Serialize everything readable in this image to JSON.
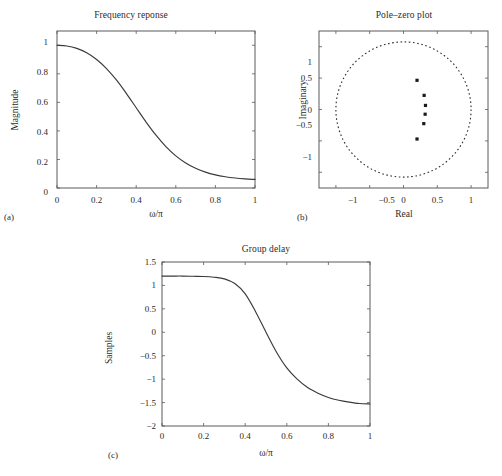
{
  "figure": {
    "background": "#ffffff",
    "line_color": "#3a3a3a",
    "axis_color": "#5a5a5a",
    "marker_color": "#1a1a1a"
  },
  "panels": {
    "a": {
      "caption": "(a)",
      "title": "Frequency reponse",
      "xlabel": "ω/π",
      "ylabel": "Magnitude",
      "xticks": [
        "0",
        "0.2",
        "0.4",
        "0.6",
        "0.8",
        "1"
      ],
      "yticks": [
        "0",
        "0.2",
        "0.4",
        "0.6",
        "0.8",
        "1"
      ]
    },
    "b": {
      "caption": "(b)",
      "title": "Pole–zero plot",
      "xlabel": "Real",
      "ylabel": "Imaginary",
      "xticks": [
        "−1",
        "−0.5",
        "0",
        "0.5",
        "1"
      ],
      "yticks": [
        "−1",
        "−0.5",
        "0",
        "0.5",
        "1"
      ]
    },
    "c": {
      "caption": "(c)",
      "title": "Group delay",
      "xlabel": "ω/π",
      "ylabel": "Samples",
      "xticks": [
        "0",
        "0.2",
        "0.4",
        "0.6",
        "0.8",
        "1"
      ],
      "yticks": [
        "1.5",
        "1",
        "0.5",
        "0",
        "−0.5",
        "−1",
        "−1.5",
        "−2"
      ]
    }
  },
  "chart_data": [
    {
      "type": "line",
      "id": "frequency-response",
      "title": "Frequency reponse",
      "xlabel": "ω/π",
      "ylabel": "Magnitude",
      "xlim": [
        0,
        1
      ],
      "ylim": [
        0,
        1.1
      ],
      "xticks": [
        0,
        0.2,
        0.4,
        0.6,
        0.8,
        1
      ],
      "yticks": [
        0,
        0.2,
        0.4,
        0.6,
        0.8,
        1
      ],
      "grid": false,
      "legend": null,
      "x": [
        0,
        0.05,
        0.1,
        0.15,
        0.2,
        0.25,
        0.3,
        0.35,
        0.4,
        0.45,
        0.5,
        0.55,
        0.6,
        0.65,
        0.7,
        0.75,
        0.8,
        0.85,
        0.9,
        0.95,
        1
      ],
      "values": [
        1.0,
        0.995,
        0.978,
        0.947,
        0.9,
        0.837,
        0.757,
        0.663,
        0.562,
        0.462,
        0.37,
        0.29,
        0.225,
        0.175,
        0.138,
        0.111,
        0.092,
        0.079,
        0.07,
        0.064,
        0.06
      ]
    },
    {
      "type": "scatter",
      "id": "pole-zero-plot",
      "title": "Pole–zero plot",
      "xlabel": "Real",
      "ylabel": "Imaginary",
      "xlim": [
        -1.25,
        1.25
      ],
      "ylim": [
        -1.25,
        1.25
      ],
      "xticks": [
        -1,
        -0.5,
        0,
        0.5,
        1
      ],
      "yticks": [
        -1,
        -0.5,
        0,
        0.5,
        1
      ],
      "grid": false,
      "legend": null,
      "unit_circle": {
        "radius": 1,
        "style": "dashed",
        "center": [
          0,
          0
        ]
      },
      "points_label": "poles",
      "points": [
        {
          "real": 0.2,
          "imag": 0.465
        },
        {
          "real": 0.305,
          "imag": 0.225
        },
        {
          "real": 0.325,
          "imag": 0.065
        },
        {
          "real": 0.32,
          "imag": -0.075
        },
        {
          "real": 0.3,
          "imag": -0.225
        },
        {
          "real": 0.2,
          "imag": -0.47
        }
      ]
    },
    {
      "type": "line",
      "id": "group-delay",
      "title": "Group delay",
      "xlabel": "ω/π",
      "ylabel": "Samples",
      "xlim": [
        0,
        1
      ],
      "ylim": [
        -2,
        1.5
      ],
      "xticks": [
        0,
        0.2,
        0.4,
        0.6,
        0.8,
        1
      ],
      "yticks": [
        1.5,
        1,
        0.5,
        0,
        -0.5,
        -1,
        -1.5,
        -2
      ],
      "grid": false,
      "legend": null,
      "x": [
        0,
        0.05,
        0.1,
        0.15,
        0.2,
        0.25,
        0.3,
        0.35,
        0.4,
        0.45,
        0.5,
        0.55,
        0.6,
        0.65,
        0.7,
        0.75,
        0.8,
        0.85,
        0.9,
        0.95,
        1
      ],
      "values": [
        1.2,
        1.2,
        1.2,
        1.195,
        1.19,
        1.175,
        1.14,
        1.04,
        0.82,
        0.44,
        0.0,
        -0.42,
        -0.76,
        -1.0,
        -1.18,
        -1.3,
        -1.39,
        -1.45,
        -1.49,
        -1.52,
        -1.53
      ]
    }
  ]
}
